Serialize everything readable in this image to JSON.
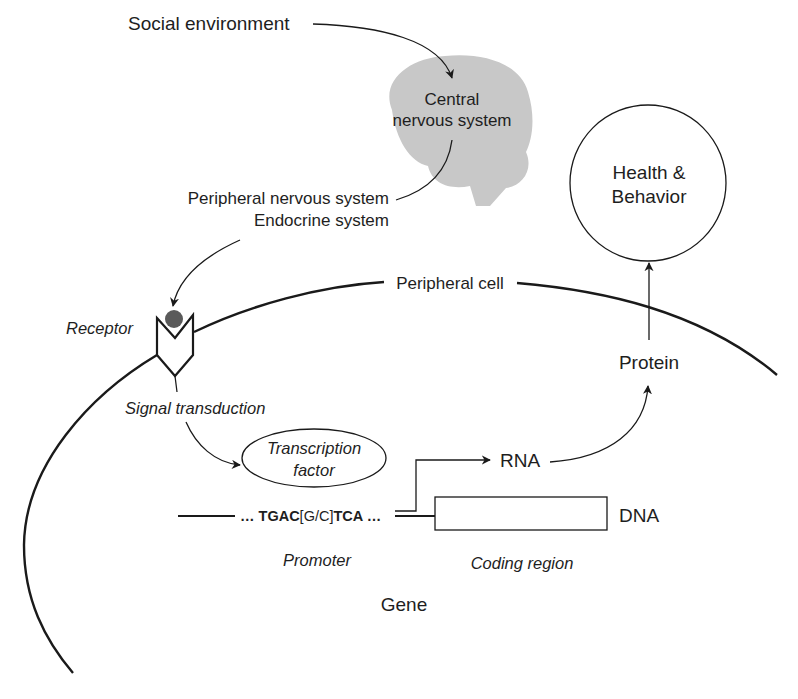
{
  "diagram": {
    "colors": {
      "ink": "#1a1a1a",
      "brain_fill": "#c8c8c8",
      "ligand_fill": "#5a5a5a",
      "background": "#ffffff"
    },
    "nodes": {
      "social_environment": "Social environment",
      "cns_line1": "Central",
      "cns_line2": "nervous system",
      "pns": "Peripheral nervous system",
      "endocrine": "Endocrine system",
      "health_line1": "Health &",
      "health_line2": "Behavior",
      "peripheral_cell": "Peripheral cell",
      "receptor": "Receptor",
      "signal_transduction": "Signal transduction",
      "tf_line1": "Transcription",
      "tf_line2": "factor",
      "protein": "Protein",
      "rna": "RNA",
      "dna": "DNA",
      "promoter": "Promoter",
      "coding_region": "Coding region",
      "gene": "Gene"
    },
    "sequence": {
      "lead": "… TGAC",
      "variable": "[G/C]",
      "tail": "TCA …"
    },
    "edges": [
      {
        "from": "Social environment",
        "to": "Central nervous system"
      },
      {
        "from": "Central nervous system",
        "to": "Peripheral nervous system / Endocrine system"
      },
      {
        "from": "Peripheral nervous system / Endocrine system",
        "to": "Receptor"
      },
      {
        "from": "Receptor",
        "to": "Signal transduction"
      },
      {
        "from": "Signal transduction",
        "to": "Transcription factor"
      },
      {
        "from": "Promoter",
        "to": "RNA"
      },
      {
        "from": "RNA",
        "to": "Protein"
      },
      {
        "from": "Protein",
        "to": "Health & Behavior"
      }
    ]
  }
}
